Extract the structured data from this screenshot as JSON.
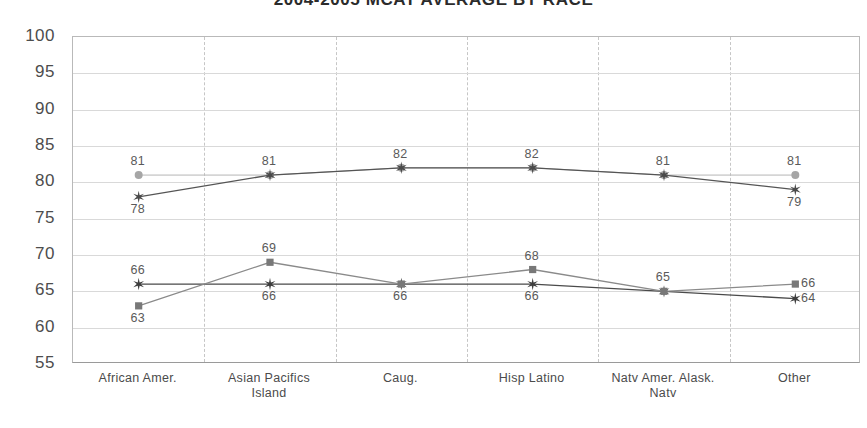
{
  "chart_data": {
    "type": "line",
    "title": "2004-2005 MCAT AVERAGE BY RACE",
    "xlabel": "",
    "ylabel": "",
    "ylim": [
      55,
      100
    ],
    "ystep": 5,
    "yticks": [
      "100",
      "95",
      "90",
      "85",
      "80",
      "75",
      "70",
      "65",
      "60",
      "55"
    ],
    "grid": "horizontal-solid-and-vertical-dashed",
    "legend": "none",
    "categories": [
      "African Amer.",
      "Asian Pacifics Island",
      "Caug.",
      "Hisp Latino",
      "Natv Amer. Alask. Natv",
      "Other"
    ],
    "category_lines": [
      [
        "African Amer."
      ],
      [
        "Asian Pacifics",
        "Island"
      ],
      [
        "Caug."
      ],
      [
        "Hisp Latino"
      ],
      [
        "Natv Amer. Alask.",
        "Natv"
      ],
      [
        "Other"
      ]
    ],
    "series": [
      {
        "name": "upper-circle-series",
        "marker": "circle",
        "color": "#a6a6a6",
        "line_color": "#b5b5b5",
        "values": [
          81,
          81,
          82,
          82,
          81,
          81
        ],
        "labels": [
          "81",
          "81",
          "82",
          "82",
          "81",
          "81"
        ],
        "label_positions": [
          "above",
          "above",
          "above",
          "above",
          "above",
          "above"
        ]
      },
      {
        "name": "upper-star-series",
        "marker": "star",
        "color": "#4a4a4a",
        "line_color": "#555555",
        "values": [
          78,
          81,
          82,
          82,
          81,
          79
        ],
        "labels": [
          "78",
          "81",
          "82",
          "82",
          "81",
          "79"
        ],
        "label_positions": [
          "below",
          "hidden",
          "hidden",
          "hidden",
          "hidden",
          "below"
        ]
      },
      {
        "name": "lower-star-series",
        "marker": "star",
        "color": "#3d3d3d",
        "line_color": "#4a4a4a",
        "values": [
          66,
          66,
          66,
          66,
          65,
          64
        ],
        "labels": [
          "66",
          "66",
          "66",
          "66",
          "65",
          "64"
        ],
        "label_positions": [
          "above",
          "below",
          "below",
          "below",
          "hidden",
          "right"
        ]
      },
      {
        "name": "lower-square-series",
        "marker": "square",
        "color": "#787878",
        "line_color": "#8a8a8a",
        "values": [
          63,
          69,
          66,
          68,
          65,
          66
        ],
        "labels": [
          "63",
          "69",
          "66",
          "68",
          "65",
          "66"
        ],
        "label_positions": [
          "below",
          "above",
          "hidden",
          "above",
          "above",
          "right"
        ]
      }
    ]
  }
}
